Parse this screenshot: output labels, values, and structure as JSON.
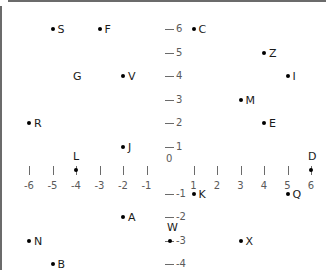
{
  "chart_data": {
    "type": "scatter",
    "title": "",
    "xlabel": "",
    "ylabel": "",
    "xlim": [
      -6.6,
      6.6
    ],
    "ylim": [
      -4.4,
      6.6
    ],
    "grid": false,
    "legend": null,
    "x_ticks": [
      -6,
      -5,
      -4,
      -3,
      -2,
      -1,
      0,
      1,
      2,
      3,
      4,
      5,
      6
    ],
    "y_ticks": [
      6,
      5,
      4,
      3,
      2,
      1,
      0,
      -1,
      -2,
      -3,
      -4
    ],
    "x_tick_labels": [
      "-6",
      "-5",
      "-4",
      "-3",
      "-2",
      "-1",
      "0",
      "1",
      "2",
      "3",
      "4",
      "5",
      "6"
    ],
    "y_tick_labels": [
      "6",
      "5",
      "4",
      "3",
      "2",
      "1",
      "0",
      "-1",
      "-2",
      "-3",
      "-4"
    ],
    "origin_label": "0",
    "axis_color": "#6b6b6b",
    "point_color": "#000000",
    "tick_label_color": "#5a5a5a",
    "points": [
      {
        "label": "S",
        "x": -5,
        "y": 6,
        "has_dot": true,
        "label_side": "right"
      },
      {
        "label": "F",
        "x": -3,
        "y": 6,
        "has_dot": true,
        "label_side": "right"
      },
      {
        "label": "C",
        "x": 1,
        "y": 6,
        "has_dot": true,
        "label_side": "right"
      },
      {
        "label": "Z",
        "x": 4,
        "y": 5,
        "has_dot": true,
        "label_side": "right"
      },
      {
        "label": "G",
        "x": -4,
        "y": 4,
        "has_dot": false,
        "label_side": "center"
      },
      {
        "label": "V",
        "x": -2,
        "y": 4,
        "has_dot": true,
        "label_side": "right"
      },
      {
        "label": "I",
        "x": 5,
        "y": 4,
        "has_dot": true,
        "label_side": "right"
      },
      {
        "label": "M",
        "x": 3,
        "y": 3,
        "has_dot": true,
        "label_side": "right"
      },
      {
        "label": "R",
        "x": -6,
        "y": 2,
        "has_dot": true,
        "label_side": "right"
      },
      {
        "label": "E",
        "x": 4,
        "y": 2,
        "has_dot": true,
        "label_side": "right"
      },
      {
        "label": "J",
        "x": -2,
        "y": 1,
        "has_dot": true,
        "label_side": "right"
      },
      {
        "label": "L",
        "x": -4,
        "y": 0,
        "has_dot": true,
        "label_side": "above"
      },
      {
        "label": "D",
        "x": 6,
        "y": 0,
        "has_dot": true,
        "label_side": "above"
      },
      {
        "label": "K",
        "x": 1,
        "y": -1,
        "has_dot": true,
        "label_side": "right"
      },
      {
        "label": "Q",
        "x": 5,
        "y": -1,
        "has_dot": true,
        "label_side": "right"
      },
      {
        "label": "A",
        "x": -2,
        "y": -2,
        "has_dot": true,
        "label_side": "right"
      },
      {
        "label": "W",
        "x": 0,
        "y": -3,
        "has_dot": true,
        "label_side": "above"
      },
      {
        "label": "N",
        "x": -6,
        "y": -3,
        "has_dot": true,
        "label_side": "right"
      },
      {
        "label": "X",
        "x": 3,
        "y": -3,
        "has_dot": true,
        "label_side": "right"
      },
      {
        "label": "B",
        "x": -5,
        "y": -4,
        "has_dot": true,
        "label_side": "right"
      }
    ]
  }
}
